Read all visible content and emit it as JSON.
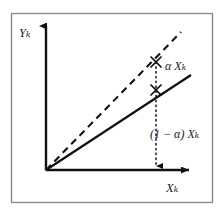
{
  "figure": {
    "title_shown": false,
    "background_color": "#ffffff",
    "frame": {
      "stroke": "#8a8a8a",
      "x": 11,
      "y": 13,
      "width": 202,
      "height": 190
    },
    "axes": {
      "origin": {
        "x": 46,
        "y": 170
      },
      "stroke": "#111111",
      "y_axis": {
        "label": "Yₖ",
        "label_plain": "Y_k",
        "from": {
          "x": 46,
          "y": 170
        },
        "to": {
          "x": 46,
          "y": 22
        },
        "arrow": "up"
      },
      "x_axis": {
        "label": "Xₖ",
        "label_plain": "X_k",
        "from": {
          "x": 46,
          "y": 170
        },
        "to": {
          "x": 196,
          "y": 170
        },
        "arrow": "right"
      }
    },
    "series": [
      {
        "name": "upper-reference-line",
        "style": "dashed",
        "stroke": "#111111",
        "from": {
          "x": 46,
          "y": 170
        },
        "to": {
          "x": 181,
          "y": 32
        }
      },
      {
        "name": "lower-response-line",
        "style": "solid",
        "stroke": "#111111",
        "from": {
          "x": 46,
          "y": 170
        },
        "to": {
          "x": 191,
          "y": 75
        }
      },
      {
        "name": "vertical-drop-line",
        "style": "dotted",
        "stroke": "#111111",
        "from": {
          "x": 156,
          "y": 62
        },
        "to": {
          "x": 156,
          "y": 172
        },
        "arrow": "down"
      }
    ],
    "markers": [
      {
        "name": "intersection-dashed",
        "shape": "x-cross",
        "x": 156,
        "y": 62
      },
      {
        "name": "intersection-solid",
        "shape": "x-cross",
        "x": 156,
        "y": 90
      }
    ],
    "annotations": [
      {
        "name": "alpha-xk",
        "text": "α Xₖ",
        "text_plain": "alpha X_k",
        "x": 165,
        "y": 60
      },
      {
        "name": "one-minus-alpha-xk",
        "text": "(1 − α) Xₖ",
        "text_plain": "(1 - alpha) X_k",
        "x": 150,
        "y": 128
      }
    ]
  }
}
